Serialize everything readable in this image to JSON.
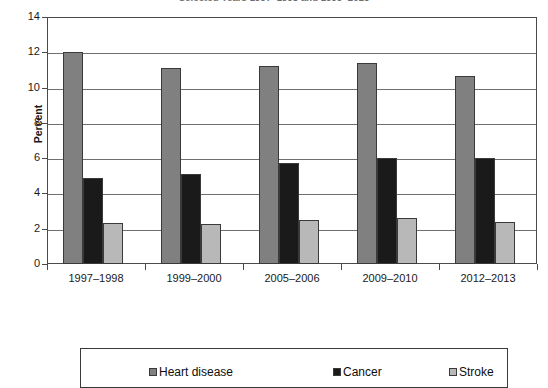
{
  "chart_data": {
    "type": "bar",
    "title": "Selected Years 1997–1998 and 1999–2013",
    "title_clipped": true,
    "xlabel": "",
    "ylabel": "Percent",
    "ylim": [
      0,
      14
    ],
    "ytick_labels": [
      "0",
      "2",
      "4",
      "6",
      "8",
      "10",
      "12",
      "14"
    ],
    "ytick_values": [
      0,
      2,
      4,
      6,
      8,
      10,
      12,
      14
    ],
    "grid": true,
    "legend_position": "bottom",
    "categories": [
      "1997–1998",
      "1999–2000",
      "2005–2006",
      "2009–2010",
      "2012–2013"
    ],
    "series": [
      {
        "name": "Heart disease",
        "color": "#808080",
        "values": [
          12.0,
          11.1,
          11.2,
          11.4,
          10.65
        ]
      },
      {
        "name": "Cancer",
        "color": "#1a1a1a",
        "values": [
          4.9,
          5.1,
          5.75,
          6.0,
          6.0
        ]
      },
      {
        "name": "Stroke",
        "color": "#b8b8b8",
        "values": [
          2.35,
          2.25,
          2.5,
          2.6,
          2.4
        ]
      }
    ]
  },
  "colors": {
    "heart_disease": "#808080",
    "cancer": "#1a1a1a",
    "stroke": "#b8b8b8",
    "axis": "#4a4a4a",
    "gridline": "#6f6f6f"
  }
}
